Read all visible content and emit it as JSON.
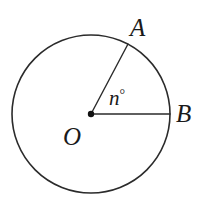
{
  "figure": {
    "kind": "geometry-diagram",
    "background_color": "#ffffff",
    "stroke_color": "#2b2b2b",
    "label_color": "#1a1a1a",
    "circle": {
      "center_x": 91,
      "center_y": 114,
      "radius": 79,
      "stroke_width": 1.6
    },
    "center_point": {
      "name": "center-dot",
      "x": 91,
      "y": 114,
      "radius": 3.2
    },
    "radii": [
      {
        "name": "radius-OA",
        "from_x": 91,
        "from_y": 114,
        "to_x": 128,
        "to_y": 44,
        "stroke_width": 1.4
      },
      {
        "name": "radius-OB",
        "from_x": 91,
        "from_y": 114,
        "to_x": 170,
        "to_y": 114,
        "stroke_width": 1.4
      }
    ],
    "labels": {
      "point_a": "A",
      "point_b": "B",
      "center_o": "O",
      "angle_variable": "n",
      "degree_symbol": "°"
    }
  }
}
